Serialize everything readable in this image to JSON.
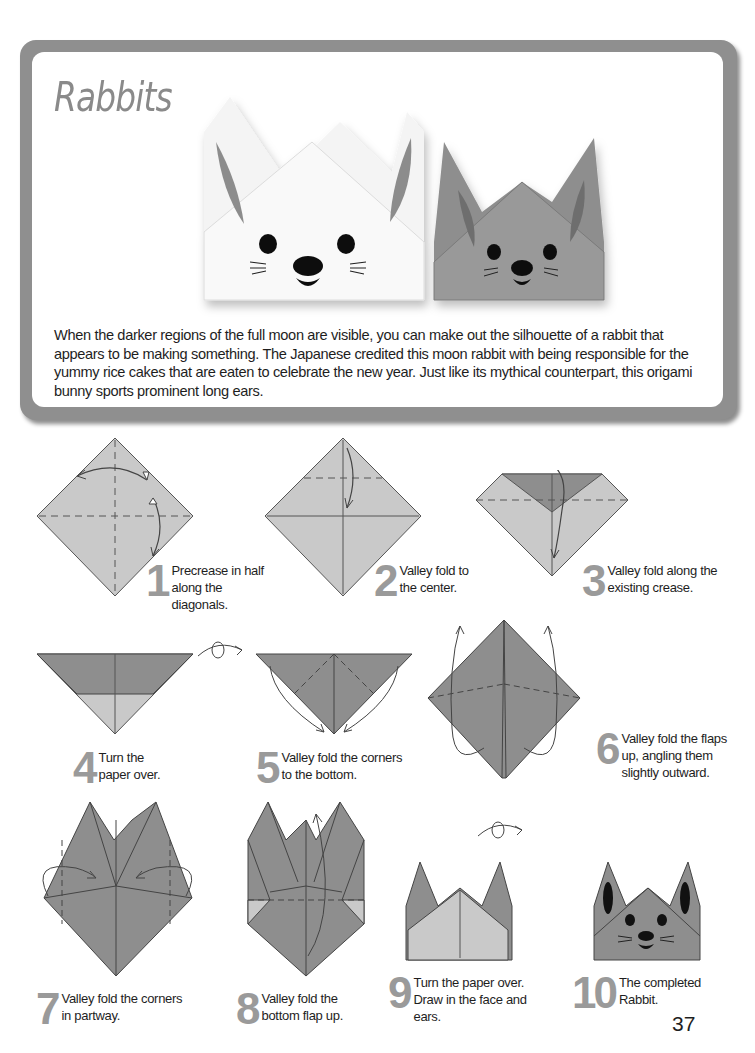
{
  "header": {
    "title": "Rabbits",
    "intro": "When the darker regions of the full moon are visible, you can make out the silhouette of a rabbit that appears to be making something. The Japanese credited this moon rabbit with being responsible for the yummy rice cakes that are eaten to celebrate the new year. Just like its mythical counterpart, this origami bunny sports prominent long ears.",
    "photo_alt": "Two finished origami rabbits, one white and one gray, with drawn faces"
  },
  "colors": {
    "frame": "#8f8f8f",
    "paper_light": "#c9c9c9",
    "paper_dark": "#8e8e8e",
    "step_number": "#9a9a9a"
  },
  "steps": [
    {
      "number": "1",
      "caption": "Precrease in half along the diagonals."
    },
    {
      "number": "2",
      "caption": "Valley fold to the center."
    },
    {
      "number": "3",
      "caption": "Valley fold along the existing crease."
    },
    {
      "number": "4",
      "caption": "Turn the paper over."
    },
    {
      "number": "5",
      "caption": "Valley fold the corners to the bottom."
    },
    {
      "number": "6",
      "caption": "Valley fold the flaps up, angling them slightly outward."
    },
    {
      "number": "7",
      "caption": "Valley fold the corners in partway."
    },
    {
      "number": "8",
      "caption": "Valley fold the bottom flap up."
    },
    {
      "number": "9",
      "caption": "Turn the paper over. Draw in the face and ears."
    },
    {
      "number": "10",
      "caption": "The completed Rabbit."
    }
  ],
  "page_number": "37"
}
